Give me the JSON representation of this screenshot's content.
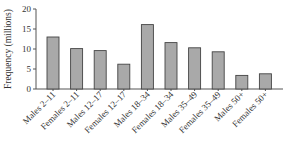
{
  "chart_data": {
    "type": "bar",
    "title": "",
    "xlabel": "",
    "ylabel": "Frequency (millions)",
    "ylim": [
      0,
      20
    ],
    "yticks": [
      0,
      5,
      10,
      15,
      20
    ],
    "grid": false,
    "legend": null,
    "categories": [
      "Males 2–11",
      "Females 2–11",
      "Males 12–17",
      "Females 12–17",
      "Males 18–34",
      "Females 18–34",
      "Males 35–49",
      "Females 35–49",
      "Males 50+",
      "Females 50+"
    ],
    "values": [
      13.0,
      10.1,
      9.6,
      6.2,
      16.1,
      11.6,
      10.3,
      9.3,
      3.4,
      3.8
    ],
    "colors": {
      "bar_fill": "#a9a9a9",
      "bar_stroke": "#444444"
    }
  }
}
